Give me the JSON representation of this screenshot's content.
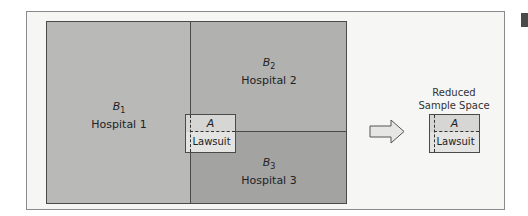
{
  "diagram": {
    "regions": [
      {
        "id": "B1",
        "symbol": "B",
        "subscript": "1",
        "name": "Hospital 1",
        "color": "#b9b9b8"
      },
      {
        "id": "B2",
        "symbol": "B",
        "subscript": "2",
        "name": "Hospital 2",
        "color": "#b1b1b0"
      },
      {
        "id": "B3",
        "symbol": "B",
        "subscript": "3",
        "name": "Hospital 3",
        "color": "#a3a3a2"
      }
    ],
    "event": {
      "symbol": "A",
      "name": "Lawsuit"
    },
    "reduced": {
      "title_line1": "Reduced",
      "title_line2": "Sample Space",
      "symbol": "A",
      "name": "Lawsuit"
    },
    "arrow": "right-arrow"
  }
}
